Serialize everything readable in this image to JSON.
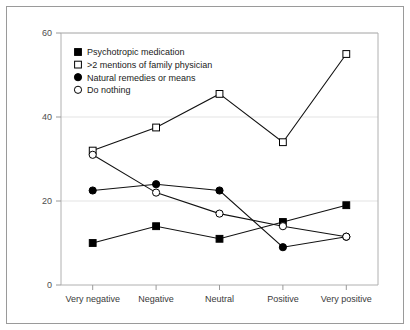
{
  "chart_data": {
    "type": "line",
    "title": "",
    "subtitle": "",
    "xlabel": "",
    "ylabel": "",
    "categories": [
      "Very negative",
      "Negative",
      "Neutral",
      "Positive",
      "Very positive"
    ],
    "ylim": [
      0,
      60
    ],
    "yticks": [
      0,
      20,
      40,
      60
    ],
    "ytick_labels": [
      "0",
      "20",
      "40",
      "60"
    ],
    "grid": "horizontal",
    "legend_position": "top-left inside plot",
    "series": [
      {
        "name": "Psychotropic medication",
        "marker": "filled-square",
        "values": [
          10,
          14,
          11,
          15,
          19
        ]
      },
      {
        "name": ">2 mentions of family physician",
        "marker": "open-square",
        "values": [
          32,
          37.5,
          45.5,
          34,
          55
        ]
      },
      {
        "name": "Natural remedies or means",
        "marker": "filled-circle",
        "values": [
          22.5,
          24,
          22.5,
          9,
          11.5
        ]
      },
      {
        "name": "Do nothing",
        "marker": "open-circle",
        "values": [
          31,
          22,
          17,
          14,
          11.5
        ]
      }
    ],
    "colors": {
      "line": "#111111",
      "marker_fill_solid": "#000000",
      "marker_fill_open": "#ffffff",
      "marker_stroke": "#000000",
      "gridline": "#e3e3e3",
      "plot_frame": "#b0b0b0",
      "outer_frame": "#9a9a9a",
      "background": "#ffffff",
      "tick_text": "#4d4d4d",
      "category_text": "#3a3a3a"
    }
  }
}
